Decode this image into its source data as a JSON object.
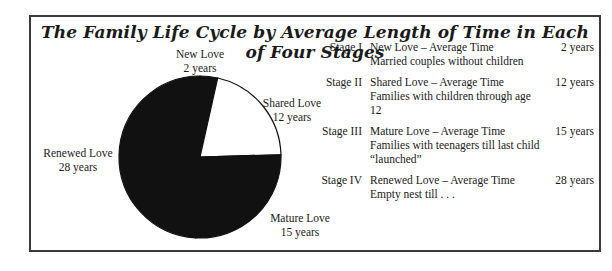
{
  "title": "The Family Life Cycle by Average Length of Time in Each of Four Stages",
  "chart_data": {
    "type": "pie",
    "title": "The Family Life Cycle by Average Length of Time in Each of Four Stages",
    "categories": [
      "New Love",
      "Shared Love",
      "Mature Love",
      "Renewed Love"
    ],
    "values": [
      2,
      12,
      15,
      28
    ],
    "units": "years",
    "slice_colors": [
      "#111111",
      "#ffffff",
      "#111111",
      "#111111"
    ],
    "start_angle_deg": 0,
    "direction": "clockwise",
    "legend_position": "right (table)"
  },
  "pie_labels": [
    {
      "name": "New Love",
      "value": "2 years"
    },
    {
      "name": "Shared Love",
      "value": "12 years"
    },
    {
      "name": "Mature Love",
      "value": "15 years"
    },
    {
      "name": "Renewed Love",
      "value": "28 years"
    }
  ],
  "stages": [
    {
      "stage": "Stage I",
      "heading": "New Love – Average Time",
      "desc": "Married couples without children",
      "years": "2 years"
    },
    {
      "stage": "Stage II",
      "heading": "Shared Love – Average Time",
      "desc": "Families with children through age 12",
      "years": "12 years"
    },
    {
      "stage": "Stage III",
      "heading": "Mature Love – Average Time",
      "desc": "Families with teenagers till last child “launched”",
      "years": "15 years"
    },
    {
      "stage": "Stage IV",
      "heading": "Renewed Love – Average Time",
      "desc": "Empty nest till . . .",
      "years": "28 years"
    }
  ]
}
